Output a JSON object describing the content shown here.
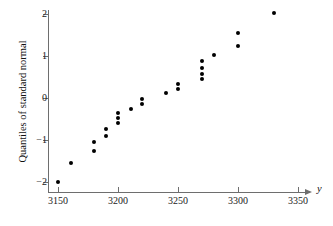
{
  "chart_data": {
    "type": "scatter",
    "title": "",
    "xlabel": "y",
    "ylabel": "Quantiles of standard normal",
    "xlim": [
      3135,
      3365
    ],
    "ylim": [
      -2.33,
      2.33
    ],
    "xticks": [
      3150,
      3200,
      3250,
      3300,
      3350
    ],
    "xtick_labels": [
      "3150",
      "3200",
      "3250",
      "3300",
      "3350"
    ],
    "yticks": [
      2,
      1,
      0,
      -1,
      -2
    ],
    "ytick_labels": [
      "2",
      "1",
      "0",
      "−1",
      "−2"
    ],
    "grid": false,
    "legend": false,
    "x_axis_arrow": true,
    "marker": "filled-circle",
    "marker_color": "#000000",
    "points": [
      {
        "x": 3150,
        "y": -2.0
      },
      {
        "x": 3161,
        "y": -1.55
      },
      {
        "x": 3180,
        "y": -1.26
      },
      {
        "x": 3180,
        "y": -1.05
      },
      {
        "x": 3190,
        "y": -0.9
      },
      {
        "x": 3190,
        "y": -0.73
      },
      {
        "x": 3200,
        "y": -0.6
      },
      {
        "x": 3200,
        "y": -0.48
      },
      {
        "x": 3200,
        "y": -0.36
      },
      {
        "x": 3211,
        "y": -0.25
      },
      {
        "x": 3220,
        "y": -0.14
      },
      {
        "x": 3220,
        "y": -0.02
      },
      {
        "x": 3240,
        "y": 0.11
      },
      {
        "x": 3250,
        "y": 0.22
      },
      {
        "x": 3250,
        "y": 0.34
      },
      {
        "x": 3270,
        "y": 0.45
      },
      {
        "x": 3270,
        "y": 0.58
      },
      {
        "x": 3270,
        "y": 0.72
      },
      {
        "x": 3270,
        "y": 0.88
      },
      {
        "x": 3280,
        "y": 1.03
      },
      {
        "x": 3300,
        "y": 1.24
      },
      {
        "x": 3300,
        "y": 1.54
      },
      {
        "x": 3330,
        "y": 2.02
      }
    ]
  },
  "axes": {
    "y_title": "Quantiles of standard normal",
    "x_title": "y"
  }
}
